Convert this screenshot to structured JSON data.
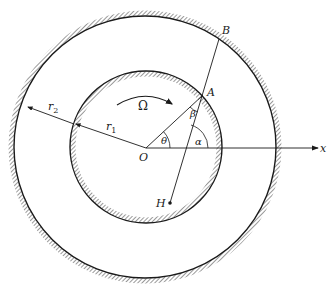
{
  "diagram": {
    "colors": {
      "line": "#1a1a1a",
      "hatch": "#333333",
      "background": "#ffffff"
    },
    "labels": {
      "B": "B",
      "A": "A",
      "O": "O",
      "H": "H",
      "x": "x",
      "r1": "r",
      "r1_sub": "1",
      "r2": "r",
      "r2_sub": "2",
      "Omega": "Ω",
      "theta": "θ",
      "beta": "β",
      "alpha": "α"
    },
    "elements": {
      "outer_circle": {
        "radius_label": "r2"
      },
      "inner_circle": {
        "radius_label": "r1"
      },
      "x_axis": {
        "label": "x"
      },
      "rotation_arrow": {
        "label": "Ω",
        "direction": "clockwise"
      },
      "line_HB": {
        "through": [
          "H",
          "A",
          "B"
        ]
      },
      "line_OA": {
        "from": "O",
        "to": "A"
      },
      "angles": [
        "θ (between x-axis and OA)",
        "β (between OA and AB at A)",
        "α (between x-axis and line HB)"
      ]
    }
  }
}
